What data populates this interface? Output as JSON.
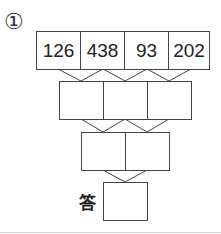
{
  "problem": {
    "number_label": "①",
    "row1": [
      "126",
      "438",
      "93",
      "202"
    ],
    "row2": [
      "",
      "",
      ""
    ],
    "row3": [
      "",
      ""
    ],
    "answer_label": "答",
    "answer_value": ""
  }
}
